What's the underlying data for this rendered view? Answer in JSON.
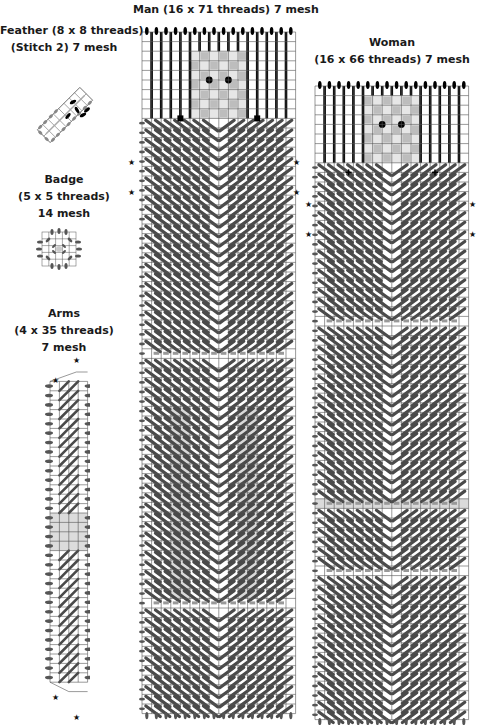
{
  "diagram": {
    "type": "needlepoint-chart",
    "pieces": {
      "feather": {
        "title": "Feather (8 x 8 threads)",
        "subtitle": "(Stitch 2) 7 mesh",
        "cols": 8,
        "rows": 8
      },
      "badge": {
        "title": "Badge",
        "subtitle": "(5 x 5 threads)",
        "mesh": "14 mesh",
        "cols": 5,
        "rows": 5
      },
      "arms": {
        "title": "Arms",
        "subtitle": "(4 x 35 threads)",
        "mesh": "7 mesh",
        "cols": 4,
        "rows": 35
      },
      "man": {
        "title": "Man (16 x 71 threads) 7 mesh",
        "cols": 16,
        "rows": 71
      },
      "woman": {
        "title": "Woman",
        "subtitle": "(16 x 66 threads) 7 mesh",
        "cols": 16,
        "rows": 66
      }
    },
    "marker_symbol": "★",
    "colors": {
      "grid": "#555555",
      "stitch_dark": "#4a4a4a",
      "hair": "#000000",
      "light_fill": "#d8d8d8",
      "background": "#ffffff"
    }
  }
}
